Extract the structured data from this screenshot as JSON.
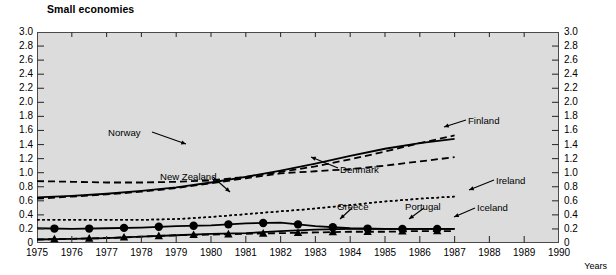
{
  "chart_data": {
    "type": "line",
    "title": "Small economies",
    "xlabel": "Years",
    "ylabel": "",
    "xlim": [
      1975,
      1990
    ],
    "ylim": [
      0,
      3.0
    ],
    "grid": false,
    "legend_position": "inline-annotations",
    "x_ticks": [
      "1975",
      "1976",
      "1977",
      "1978",
      "1979",
      "1980",
      "1981",
      "1982",
      "1983",
      "1984",
      "1985",
      "1986",
      "1987",
      "1988",
      "1989",
      "1990"
    ],
    "y_ticks": [
      "3.0",
      "2.8",
      "2.6",
      "2.4",
      "2.2",
      "2.0",
      "1.8",
      "1.6",
      "1.4",
      "1.2",
      "1.0",
      "0.8",
      "0.6",
      "0.4",
      "0.2",
      "0"
    ],
    "y_ticks_right": [
      "3.0",
      "2.8",
      "2.6",
      "2.4",
      "2.2",
      "2.0",
      "1.8",
      "1.6",
      "1.4",
      "1.2",
      "1.0",
      "0.8",
      "0.6",
      "0.4",
      "0.2",
      "0"
    ],
    "x": [
      1975,
      1976,
      1977,
      1978,
      1979,
      1980,
      1981,
      1982,
      1983,
      1984,
      1985,
      1986,
      1987
    ],
    "series": [
      {
        "name": "Norway",
        "style": "dashed",
        "marker": "none",
        "color": "#000000",
        "values": [
          0.88,
          0.87,
          0.86,
          0.86,
          0.87,
          0.89,
          0.94,
          1.01,
          1.09,
          1.19,
          1.3,
          1.42,
          1.53
        ]
      },
      {
        "name": "Finland",
        "style": "solid",
        "marker": "none",
        "color": "#000000",
        "values": [
          0.65,
          0.67,
          0.7,
          0.74,
          0.79,
          0.86,
          0.94,
          1.03,
          1.13,
          1.24,
          1.34,
          1.42,
          1.48
        ]
      },
      {
        "name": "Denmark",
        "style": "dashed",
        "marker": "none",
        "color": "#000000",
        "values": [
          0.63,
          0.66,
          0.69,
          0.73,
          0.78,
          0.85,
          0.92,
          0.99,
          1.02,
          1.05,
          1.1,
          1.16,
          1.22
        ]
      },
      {
        "name": "New Zealand",
        "style": "dotted",
        "marker": "none",
        "color": "#000000",
        "values": [
          0.33,
          0.33,
          0.33,
          0.33,
          0.34,
          0.37,
          0.41,
          0.45,
          0.49,
          0.54,
          0.59,
          0.63,
          0.66
        ]
      },
      {
        "name": "Ireland",
        "style": "dotted",
        "marker": "none",
        "color": "#000000",
        "values": [
          0.33,
          0.33,
          0.33,
          0.33,
          0.34,
          0.37,
          0.41,
          0.45,
          0.49,
          0.54,
          0.59,
          0.63,
          0.66
        ]
      },
      {
        "name": "Greece",
        "style": "solid",
        "marker": "circle",
        "color": "#000000",
        "values": [
          0.21,
          0.2,
          0.21,
          0.22,
          0.24,
          0.25,
          0.28,
          0.29,
          0.24,
          0.21,
          0.2,
          0.2,
          0.2
        ]
      },
      {
        "name": "Portugal",
        "style": "dashed",
        "marker": "triangle",
        "color": "#000000",
        "values": [
          0.05,
          0.06,
          0.07,
          0.09,
          0.11,
          0.12,
          0.13,
          0.14,
          0.15,
          0.16,
          0.16,
          0.17,
          0.17
        ]
      },
      {
        "name": "Iceland",
        "style": "solid",
        "marker": "none",
        "color": "#000000",
        "values": [
          0.05,
          0.06,
          0.07,
          0.09,
          0.11,
          0.13,
          0.14,
          0.17,
          0.19,
          0.2,
          0.2,
          0.2,
          0.2
        ]
      }
    ],
    "annotations": [
      {
        "label": "Norway",
        "x": 108,
        "y": 128
      },
      {
        "label": "New Zealand",
        "x": 160,
        "y": 172
      },
      {
        "label": "Finland",
        "x": 468,
        "y": 116
      },
      {
        "label": "Denmark",
        "x": 340,
        "y": 165
      },
      {
        "label": "Ireland",
        "x": 496,
        "y": 176
      },
      {
        "label": "Greece",
        "x": 337,
        "y": 202
      },
      {
        "label": "Portugal",
        "x": 405,
        "y": 202
      },
      {
        "label": "Iceland",
        "x": 477,
        "y": 203
      }
    ]
  }
}
